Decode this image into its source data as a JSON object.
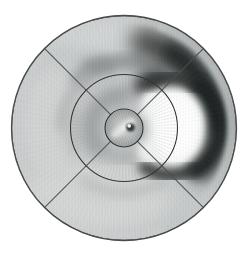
{
  "figure": {
    "kind": "grayscale polar intensity map (bull's-eye plot)",
    "background": "#ffffff"
  },
  "chart_data": {
    "type": "heatmap",
    "projection": "polar",
    "title": "",
    "xlabel": "",
    "ylabel": "",
    "legend": null,
    "canvas": {
      "width": 248,
      "height": 254,
      "background": "#ffffff"
    },
    "center": {
      "x": 124,
      "y": 128
    },
    "base_gray": "#c9cccc",
    "rings": [
      {
        "name": "outer-boundary",
        "r": 112.5,
        "stroke": "#4a4c4c",
        "w": 1.3
      },
      {
        "name": "middle-ring",
        "r": 53.5,
        "stroke": "#343636",
        "w": 1.1
      },
      {
        "name": "inner-ring",
        "r": 19,
        "stroke": "#2e3030",
        "w": 1.1
      }
    ],
    "cross_lines": {
      "angles_deg": [
        45,
        135
      ],
      "stroke": "#4f4f4f",
      "w": 1.2,
      "op": 0.9
    },
    "features": [
      {
        "kind": "blob",
        "name": "light-bottom",
        "cx": 95,
        "cy": 196,
        "rx": 76,
        "ry": 34,
        "fill": "#d5d7d7",
        "blur": 8,
        "op": 1
      },
      {
        "kind": "blob",
        "name": "light-left",
        "cx": 52,
        "cy": 124,
        "rx": 30,
        "ry": 56,
        "fill": "#d3d5d5",
        "blur": 8,
        "op": 1
      },
      {
        "kind": "blob",
        "name": "light-top",
        "cx": 116,
        "cy": 34,
        "rx": 74,
        "ry": 15,
        "fill": "#d3d6d6",
        "blur": 7,
        "op": 1
      },
      {
        "kind": "arc",
        "name": "top-wavy-band",
        "r": 66,
        "a1": 46,
        "a2": 133,
        "w": 15,
        "stroke": "#989c9c",
        "blur": 5,
        "op": 0.9
      },
      {
        "kind": "blob",
        "name": "top-band-dip",
        "cx": 99,
        "cy": 65,
        "rx": 18,
        "ry": 8,
        "fill": "#909595",
        "blur": 5,
        "op": 0.8
      },
      {
        "kind": "arc",
        "name": "upper-left-mid-band",
        "r": 62,
        "a1": 128,
        "a2": 178,
        "w": 12,
        "stroke": "#b3b6b6",
        "blur": 5,
        "op": 0.8
      },
      {
        "kind": "arc",
        "name": "bottom-mid-band",
        "r": 66,
        "a1": -127,
        "a2": -53,
        "w": 11,
        "stroke": "#b6b9b9",
        "blur": 6,
        "op": 0.7
      },
      {
        "kind": "blob",
        "name": "left-smudge",
        "cx": 74,
        "cy": 130,
        "rx": 9,
        "ry": 26,
        "fill": "#b9bcbc",
        "blur": 6,
        "op": 0.8
      },
      {
        "kind": "arc",
        "name": "inner-zone-upper-left",
        "r": 33,
        "a1": 92,
        "a2": 215,
        "w": 18,
        "stroke": "#9da0a0",
        "blur": 6,
        "op": 0.85
      },
      {
        "kind": "arc",
        "name": "inner-zone-lower",
        "r": 30,
        "a1": -142,
        "a2": -40,
        "w": 12,
        "stroke": "#a9acac",
        "blur": 6,
        "op": 0.7
      },
      {
        "kind": "arc",
        "name": "rim-dark-band",
        "r": 88,
        "a1": 76,
        "a2": -26,
        "w": 30,
        "stroke": "#464848",
        "blur": 9,
        "op": 0.95
      },
      {
        "kind": "arc",
        "name": "rim-dark-core",
        "r": 90,
        "a1": 58,
        "a2": 2,
        "w": 20,
        "stroke": "#242626",
        "blur": 7,
        "op": 0.95
      },
      {
        "kind": "blob",
        "name": "dark-wedge-above-blob",
        "cx": 150,
        "cy": 83,
        "rx": 18,
        "ry": 12,
        "rot": -20,
        "fill": "#404343",
        "blur": 6,
        "op": 0.9
      },
      {
        "kind": "blob",
        "name": "white-blob-main",
        "cx": 172,
        "cy": 127,
        "rx": 34,
        "ry": 43,
        "fill": "#f7f8f8",
        "blur": 5,
        "op": 1
      },
      {
        "kind": "blob",
        "name": "white-lobe-top",
        "cx": 154,
        "cy": 101,
        "rx": 12,
        "ry": 11,
        "fill": "#fafbfb",
        "blur": 4,
        "op": 1
      },
      {
        "kind": "blob",
        "name": "white-lobe-bottom",
        "cx": 150,
        "cy": 151,
        "rx": 13,
        "ry": 12,
        "fill": "#f5f6f6",
        "blur": 4,
        "op": 1
      },
      {
        "kind": "blob",
        "name": "white-core",
        "cx": 176,
        "cy": 126,
        "rx": 24,
        "ry": 32,
        "fill": "#ffffff",
        "blur": 4,
        "op": 1
      },
      {
        "kind": "blob",
        "name": "indent-left-of-blob",
        "cx": 140,
        "cy": 129,
        "rx": 8,
        "ry": 13,
        "fill": "#b6b9b9",
        "blur": 4,
        "op": 0.9
      },
      {
        "kind": "arc",
        "name": "blob-ring-top",
        "cx": 171,
        "cy": 127,
        "r": 49,
        "a1": 116,
        "a2": 55,
        "w": 14,
        "stroke": "#313434",
        "blur": 5,
        "op": 0.9
      },
      {
        "kind": "arc",
        "name": "blob-ring-right",
        "cx": 171,
        "cy": 127,
        "r": 50,
        "a1": 55,
        "a2": -60,
        "w": 15,
        "stroke": "#1f2121",
        "blur": 5,
        "op": 0.95
      },
      {
        "kind": "arc",
        "name": "blob-ring-bottom",
        "cx": 171,
        "cy": 127,
        "r": 48,
        "a1": -60,
        "a2": -123,
        "w": 13,
        "stroke": "#2c2e2e",
        "blur": 5,
        "op": 0.9
      },
      {
        "kind": "arc",
        "name": "rim-light-right",
        "r": 107,
        "a1": 70,
        "a2": -70,
        "w": 6,
        "stroke": "#c5caca",
        "blur": 2.5,
        "op": 0.9
      },
      {
        "kind": "arc",
        "name": "rim-light-rest",
        "r": 108,
        "a1": 70,
        "a2": 290,
        "w": 5,
        "stroke": "#d0d3d3",
        "blur": 2.5,
        "op": 0.6
      },
      {
        "kind": "arc",
        "name": "bottom-light-wave",
        "r": 76,
        "a1": -114,
        "a2": -64,
        "w": 8,
        "stroke": "#d3d6d6",
        "blur": 4,
        "op": 0.9
      }
    ],
    "streaks": [
      {
        "name": "mid-annulus-streaks",
        "r1": 20,
        "r2": 52.5,
        "count": 90,
        "stroke": "#8a8e8e",
        "w": 0.7,
        "op": 0.22
      },
      {
        "name": "outer-annulus-streaks",
        "r1": 55,
        "r2": 110,
        "count": 120,
        "stroke": "#8a8e8e",
        "w": 0.8,
        "op": 0.06
      }
    ],
    "inner_swirl": {
      "r": 18.5,
      "fill_center": "#efefef",
      "fill_edge": "#9fa3a3",
      "streaks": {
        "r1": 2.5,
        "r2": 18,
        "count": 40,
        "stroke": "#5e6262",
        "w": 0.7,
        "op": 0.3
      },
      "parts": [
        {
          "kind": "blob",
          "name": "light-diagonal-bar",
          "cx": 123,
          "cy": 128,
          "rx": 15,
          "ry": 4.5,
          "rot": -38,
          "fill": "#e8e9e9",
          "blur": 2,
          "op": 0.85
        },
        {
          "kind": "blob",
          "name": "center-dark-spot",
          "cx": 130.5,
          "cy": 127.5,
          "rx": 4.3,
          "ry": 4.1,
          "fill": "#353838",
          "blur": 0.8,
          "op": 1
        },
        {
          "kind": "blob",
          "name": "center-spot-highlight",
          "cx": 129.2,
          "cy": 125.9,
          "rx": 1.9,
          "ry": 1.8,
          "fill": "#eeeeee",
          "blur": 0.5,
          "op": 1
        }
      ]
    },
    "texture": {
      "stripe_gap": 3,
      "stripe_color": "#000000",
      "op": 0.03
    }
  }
}
